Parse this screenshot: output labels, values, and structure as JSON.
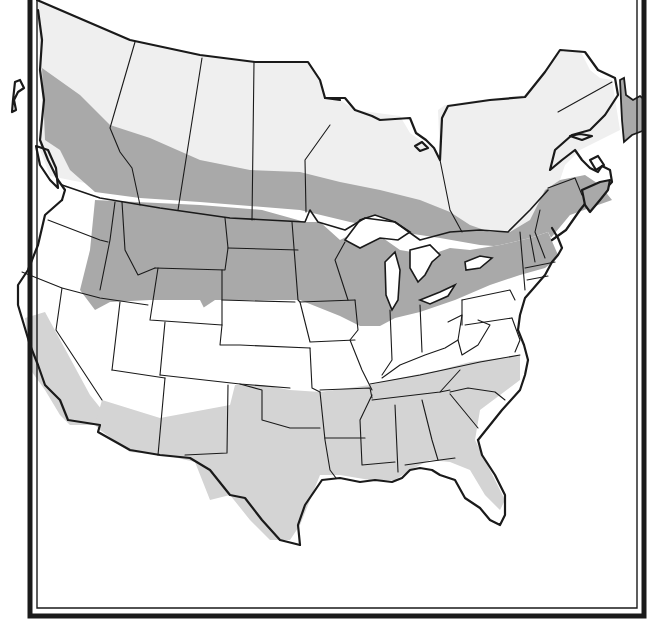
{
  "map": {
    "title": "",
    "type": "range-map",
    "region": "North America (United States and Canada)",
    "colors": {
      "background": "#ffffff",
      "canada_unshaded": "#efefef",
      "us_unshaded": "#ffffff",
      "range_primary": "#a9a9a9",
      "range_secondary": "#d4d4d4",
      "water": "#ffffff",
      "lines": "#1a1a1a"
    },
    "legend": [],
    "frame": {
      "style": "double-rule",
      "outer_stroke": "#1a1a1a",
      "inner_stroke": "#1a1a1a"
    },
    "shaded_zones": [
      {
        "name": "primary-range",
        "shade": "dark-gray",
        "description": "Band across southern Canada, Pacific Northwest, northern Rockies, northern plains, Great Lakes, and New England / Maritimes; also Newfoundland"
      },
      {
        "name": "secondary-range",
        "shade": "light-gray",
        "description": "California coast, southern Arizona & New Mexico, Texas, Oklahoma, and the southeastern states"
      }
    ]
  }
}
